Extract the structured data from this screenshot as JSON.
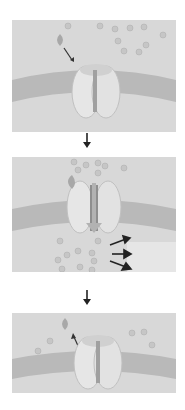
{
  "diagram": {
    "type": "ligand-gated ion channel sequence",
    "panels": [
      {
        "id": "closed",
        "state": "ligand approaching, channel closed"
      },
      {
        "id": "open",
        "state": "ligand bound, channel open, ions flowing through"
      },
      {
        "id": "released",
        "state": "ligand released, channel closed"
      }
    ],
    "colors": {
      "background": "#d6d6d6",
      "membrane": "#b8b8b8",
      "protein": "#e4e4e4",
      "ion": "#c4c4c4",
      "arrow": "#222222"
    }
  }
}
